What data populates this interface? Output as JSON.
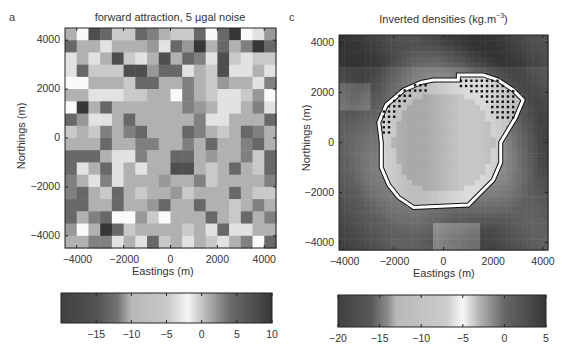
{
  "chart_data": [
    {
      "type": "heatmap",
      "panel_label": "a",
      "title": "forward attraction, 5 µgal noise",
      "xlabel": "Eastings (m)",
      "ylabel": "Northings (m)",
      "xlim": [
        -4500,
        4500
      ],
      "ylim": [
        -4500,
        4500
      ],
      "xticks": [
        -4000,
        -2000,
        0,
        2000,
        4000
      ],
      "yticks": [
        4000,
        2000,
        0,
        -2000,
        -4000
      ],
      "xtick_labels": [
        "−4000",
        "−2000",
        "0",
        "2000",
        "4000"
      ],
      "ytick_labels": [
        "4000",
        "2000",
        "0",
        "−2000",
        "−4000"
      ],
      "grid_size": [
        18,
        18
      ],
      "shade_scale_note": "0 = black, 9 = white (rows top to bottom)",
      "shades": [
        [
          6,
          9,
          2,
          3,
          7,
          7,
          3,
          4,
          6,
          7,
          7,
          3,
          9,
          3,
          1,
          9,
          8,
          5
        ],
        [
          3,
          6,
          6,
          8,
          6,
          6,
          6,
          5,
          8,
          3,
          5,
          1,
          6,
          3,
          6,
          4,
          1,
          3
        ],
        [
          8,
          6,
          8,
          6,
          2,
          7,
          8,
          6,
          2,
          6,
          3,
          4,
          8,
          2,
          7,
          8,
          7,
          7
        ],
        [
          8,
          3,
          7,
          7,
          7,
          2,
          2,
          5,
          3,
          3,
          8,
          6,
          7,
          2,
          8,
          8,
          6,
          8
        ],
        [
          9,
          9,
          6,
          6,
          6,
          7,
          3,
          3,
          6,
          6,
          4,
          6,
          7,
          5,
          6,
          6,
          8,
          4
        ],
        [
          6,
          6,
          8,
          8,
          8,
          7,
          7,
          6,
          6,
          9,
          4,
          6,
          7,
          8,
          8,
          7,
          5,
          9
        ],
        [
          9,
          1,
          6,
          3,
          6,
          6,
          6,
          6,
          6,
          6,
          4,
          5,
          6,
          8,
          8,
          6,
          4,
          8
        ],
        [
          3,
          5,
          8,
          8,
          6,
          3,
          6,
          6,
          6,
          6,
          6,
          4,
          8,
          8,
          6,
          6,
          6,
          3
        ],
        [
          7,
          6,
          7,
          4,
          6,
          4,
          3,
          6,
          6,
          6,
          3,
          4,
          6,
          7,
          6,
          3,
          4,
          6
        ],
        [
          6,
          6,
          6,
          3,
          6,
          6,
          4,
          4,
          6,
          6,
          4,
          6,
          3,
          6,
          6,
          4,
          3,
          6
        ],
        [
          3,
          3,
          3,
          6,
          8,
          8,
          4,
          6,
          6,
          3,
          3,
          6,
          5,
          6,
          6,
          4,
          7,
          3
        ],
        [
          3,
          8,
          6,
          3,
          8,
          6,
          8,
          6,
          6,
          2,
          2,
          6,
          7,
          6,
          3,
          6,
          7,
          3
        ],
        [
          4,
          6,
          8,
          4,
          8,
          6,
          6,
          6,
          5,
          6,
          6,
          4,
          7,
          6,
          6,
          6,
          6,
          4
        ],
        [
          4,
          3,
          6,
          7,
          3,
          6,
          7,
          6,
          6,
          5,
          7,
          6,
          6,
          6,
          3,
          6,
          7,
          7
        ],
        [
          3,
          3,
          6,
          6,
          3,
          6,
          6,
          5,
          3,
          6,
          6,
          3,
          6,
          6,
          7,
          6,
          4,
          6
        ],
        [
          3,
          6,
          4,
          3,
          9,
          9,
          5,
          7,
          9,
          6,
          6,
          6,
          3,
          6,
          7,
          3,
          6,
          4
        ],
        [
          5,
          9,
          6,
          1,
          3,
          7,
          6,
          6,
          6,
          6,
          7,
          6,
          8,
          3,
          8,
          8,
          6,
          6
        ],
        [
          6,
          6,
          4,
          4,
          8,
          6,
          8,
          3,
          7,
          6,
          8,
          6,
          7,
          8,
          6,
          4,
          9,
          3
        ]
      ],
      "colorbar": {
        "range": [
          -20,
          10
        ],
        "ticks": [
          -15,
          -10,
          -5,
          0,
          5,
          10
        ],
        "tick_labels": [
          "−15",
          "−10",
          "−5",
          "0",
          "5",
          "10"
        ],
        "gray_stops": [
          {
            "value": -20,
            "gray": 0.25
          },
          {
            "value": -15,
            "gray": 0.32
          },
          {
            "value": -12,
            "gray": 0.45
          },
          {
            "value": -10,
            "gray": 0.72
          },
          {
            "value": -5,
            "gray": 0.78
          },
          {
            "value": -2,
            "gray": 0.96
          },
          {
            "value": 1,
            "gray": 0.68
          },
          {
            "value": 4,
            "gray": 0.42
          },
          {
            "value": 10,
            "gray": 0.22
          }
        ]
      }
    },
    {
      "type": "heatmap",
      "panel_label": "c",
      "title": "Inverted densities (kg.m",
      "title_superscript": "−3",
      "title_suffix": ")",
      "xlabel": "Eastings (m)",
      "ylabel": "Northings (m)",
      "xlim": [
        -4200,
        4200
      ],
      "ylim": [
        -4300,
        4300
      ],
      "xticks": [
        -4000,
        -2000,
        0,
        2000,
        4000
      ],
      "yticks": [
        4000,
        2000,
        0,
        -2000,
        -4000
      ],
      "xtick_labels": [
        "−4000",
        "−2000",
        "0",
        "2000",
        "4000"
      ],
      "ytick_labels": [
        "4000",
        "2000",
        "0",
        "−2000",
        "−4000"
      ],
      "body": {
        "description": "low-density body outlined in white with black margin, dotted cells at upper-left and upper-right edges",
        "center": [
          0,
          0
        ],
        "outline_points": [
          [
            -400,
            2500
          ],
          [
            600,
            2500
          ],
          [
            600,
            2700
          ],
          [
            1600,
            2700
          ],
          [
            2200,
            2500
          ],
          [
            2800,
            2100
          ],
          [
            3200,
            1700
          ],
          [
            2900,
            1000
          ],
          [
            2600,
            500
          ],
          [
            2300,
            0
          ],
          [
            2300,
            -800
          ],
          [
            2000,
            -1500
          ],
          [
            1400,
            -2100
          ],
          [
            1000,
            -2500
          ],
          [
            -1200,
            -2600
          ],
          [
            -1800,
            -2200
          ],
          [
            -2200,
            -1700
          ],
          [
            -2500,
            -1000
          ],
          [
            -2500,
            0
          ],
          [
            -2600,
            800
          ],
          [
            -2300,
            1500
          ],
          [
            -1600,
            2100
          ],
          [
            -900,
            2400
          ]
        ]
      },
      "colorbar": {
        "range": [
          -20,
          5
        ],
        "ticks": [
          -20,
          -15,
          -10,
          -5,
          0,
          5
        ],
        "tick_labels": [
          "−20",
          "−15",
          "−10",
          "−5",
          "0",
          "5"
        ],
        "gray_stops": [
          {
            "value": -20,
            "gray": 0.25
          },
          {
            "value": -16,
            "gray": 0.35
          },
          {
            "value": -14,
            "gray": 0.55
          },
          {
            "value": -13,
            "gray": 0.72
          },
          {
            "value": -7,
            "gray": 0.8
          },
          {
            "value": -5,
            "gray": 0.97
          },
          {
            "value": -3,
            "gray": 0.7
          },
          {
            "value": 0,
            "gray": 0.4
          },
          {
            "value": 5,
            "gray": 0.22
          }
        ]
      }
    }
  ]
}
